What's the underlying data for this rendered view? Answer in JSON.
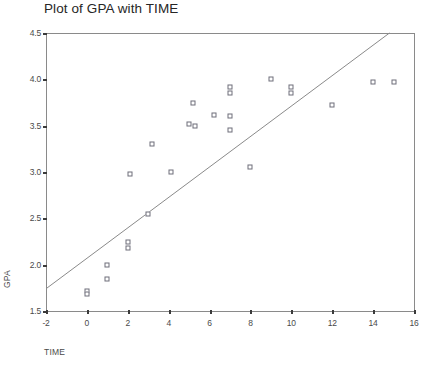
{
  "chart_data": {
    "type": "scatter",
    "title": "Plot of GPA with TIME",
    "xlabel": "TIME",
    "ylabel": "GPA",
    "xlim": [
      -2,
      16
    ],
    "ylim": [
      1.5,
      4.5
    ],
    "grid": false,
    "legend": false,
    "xticks": [
      "-2",
      "0",
      "2",
      "4",
      "6",
      "8",
      "10",
      "12",
      "14",
      "16"
    ],
    "xtick_values": [
      -2,
      0,
      2,
      4,
      6,
      8,
      10,
      12,
      14,
      16
    ],
    "yticks": [
      "4.5",
      "4.0",
      "3.5",
      "3.0",
      "2.5",
      "2.0",
      "1.5"
    ],
    "ytick_values": [
      4.5,
      4.0,
      3.5,
      3.0,
      2.5,
      2.0,
      1.5
    ],
    "marker_style": "open-square",
    "marker_color": "#6e6e7a",
    "line_color": "#8a8a8a",
    "axis_color": "#8a8a8a",
    "points": [
      {
        "x": 0.0,
        "y": 1.72
      },
      {
        "x": 0.0,
        "y": 1.68
      },
      {
        "x": 1.0,
        "y": 1.85
      },
      {
        "x": 1.0,
        "y": 2.0
      },
      {
        "x": 2.0,
        "y": 2.18
      },
      {
        "x": 2.0,
        "y": 2.25
      },
      {
        "x": 2.1,
        "y": 2.98
      },
      {
        "x": 3.0,
        "y": 2.55
      },
      {
        "x": 3.2,
        "y": 3.3
      },
      {
        "x": 4.1,
        "y": 3.0
      },
      {
        "x": 5.0,
        "y": 3.52
      },
      {
        "x": 5.2,
        "y": 3.75
      },
      {
        "x": 5.3,
        "y": 3.5
      },
      {
        "x": 6.2,
        "y": 3.62
      },
      {
        "x": 7.0,
        "y": 3.45
      },
      {
        "x": 7.0,
        "y": 3.6
      },
      {
        "x": 7.0,
        "y": 3.85
      },
      {
        "x": 7.0,
        "y": 3.92
      },
      {
        "x": 8.0,
        "y": 3.05
      },
      {
        "x": 9.0,
        "y": 4.0
      },
      {
        "x": 10.0,
        "y": 3.85
      },
      {
        "x": 10.0,
        "y": 3.92
      },
      {
        "x": 12.0,
        "y": 3.72
      },
      {
        "x": 14.0,
        "y": 3.97
      },
      {
        "x": 15.0,
        "y": 3.97
      }
    ],
    "trend_line": {
      "x_start": -2,
      "y_start": 1.74,
      "x_end": 14.8,
      "y_end": 4.5
    }
  }
}
